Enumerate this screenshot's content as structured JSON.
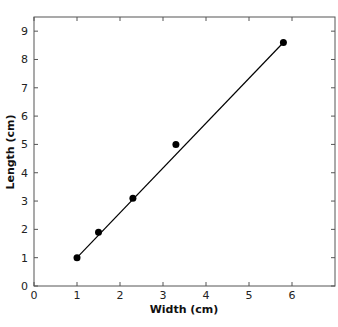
{
  "chart_data": {
    "type": "scatter",
    "title": "",
    "xlabel": "Width (cm)",
    "ylabel": "Length (cm)",
    "xlim": [
      0,
      7
    ],
    "ylim": [
      0,
      9.5
    ],
    "xticks": [
      "0",
      "1",
      "2",
      "3",
      "4",
      "5",
      "6"
    ],
    "yticks": [
      "0",
      "1",
      "2",
      "3",
      "4",
      "5",
      "6",
      "7",
      "8",
      "9"
    ],
    "grid": false,
    "legend": null,
    "series": [
      {
        "name": "data",
        "x": [
          1.0,
          1.5,
          2.3,
          3.3,
          5.8
        ],
        "y": [
          1.0,
          1.9,
          3.1,
          5.0,
          8.6
        ],
        "marker": "circle"
      }
    ],
    "fit_line": {
      "x": [
        1.0,
        5.8
      ],
      "y": [
        1.0,
        8.6
      ]
    },
    "colors": {
      "marker": "#000000",
      "line": "#000000",
      "axis": "#555555"
    }
  }
}
